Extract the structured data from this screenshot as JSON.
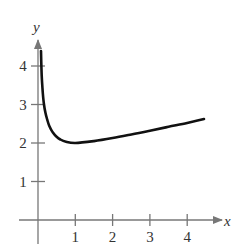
{
  "chart_data": {
    "type": "line",
    "title": "",
    "xlabel": "x",
    "ylabel": "y",
    "xlim": [
      0,
      4.6
    ],
    "ylim": [
      0,
      4.6
    ],
    "x_ticks": [
      "1",
      "2",
      "3",
      "4"
    ],
    "y_ticks": [
      "1",
      "2",
      "3",
      "4"
    ],
    "grid": false,
    "legend": null,
    "series": [
      {
        "name": "curve",
        "color": "#111111",
        "x": [
          0.08,
          0.1,
          0.13,
          0.16,
          0.2,
          0.25,
          0.3,
          0.4,
          0.5,
          0.6,
          0.75,
          1.0,
          1.5,
          2.0,
          2.5,
          3.0,
          3.5,
          4.0,
          4.45
        ],
        "y": [
          4.39,
          3.75,
          3.3,
          3.0,
          2.78,
          2.6,
          2.45,
          2.27,
          2.16,
          2.09,
          2.03,
          2.0,
          2.05,
          2.13,
          2.22,
          2.32,
          2.42,
          2.52,
          2.62
        ]
      }
    ]
  },
  "colors": {
    "axis": "#777777",
    "curve": "#111111",
    "text": "#333333"
  }
}
